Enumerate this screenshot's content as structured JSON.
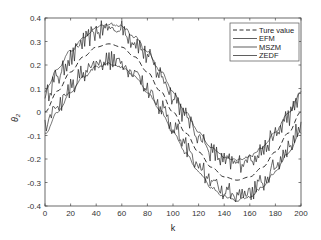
{
  "chart_data": {
    "type": "line",
    "title": "",
    "xlabel": "k",
    "ylabel": "θ2",
    "xlim": [
      0,
      200
    ],
    "ylim": [
      -0.4,
      0.4
    ],
    "xticks": [
      0,
      20,
      40,
      60,
      80,
      100,
      120,
      140,
      160,
      180,
      200
    ],
    "yticks": [
      0.4,
      0.3,
      0.2,
      0.1,
      0,
      -0.1,
      -0.2,
      -0.3,
      -0.4
    ],
    "ytick_labels": [
      "0.4",
      "0.3",
      "0.2",
      "0.1",
      "0",
      "-0.1",
      "-0.2",
      "-0.3",
      "-0.4"
    ],
    "grid": false,
    "legend_position": "upper right",
    "x": [
      0,
      10,
      20,
      30,
      40,
      50,
      60,
      70,
      80,
      90,
      100,
      110,
      120,
      130,
      140,
      150,
      160,
      170,
      180,
      190,
      200
    ],
    "series": [
      {
        "name": "Ture value",
        "style": "dashed",
        "values": [
          0.0,
          0.09,
          0.17,
          0.235,
          0.276,
          0.29,
          0.276,
          0.235,
          0.17,
          0.09,
          0.0,
          -0.09,
          -0.17,
          -0.235,
          -0.276,
          -0.29,
          -0.276,
          -0.235,
          -0.17,
          -0.09,
          0.0
        ]
      },
      {
        "name": "EFM",
        "style": "solid-noisy",
        "values": [
          0.07,
          0.15,
          0.23,
          0.3,
          0.34,
          0.36,
          0.35,
          0.3,
          0.24,
          0.16,
          0.07,
          -0.02,
          -0.1,
          -0.17,
          -0.21,
          -0.22,
          -0.2,
          -0.16,
          -0.1,
          -0.02,
          0.07
        ]
      },
      {
        "name": "MSZM",
        "style": "solid-noisy",
        "values": [
          -0.06,
          0.03,
          0.1,
          0.17,
          0.21,
          0.22,
          0.21,
          0.17,
          0.1,
          0.03,
          -0.06,
          -0.15,
          -0.23,
          -0.3,
          -0.34,
          -0.35,
          -0.34,
          -0.3,
          -0.23,
          -0.15,
          -0.06
        ]
      },
      {
        "name": "ZEDF",
        "style": "solid-smooth-envelope",
        "upper": [
          0.09,
          0.18,
          0.26,
          0.32,
          0.36,
          0.375,
          0.365,
          0.32,
          0.255,
          0.175,
          0.085,
          -0.005,
          -0.085,
          -0.15,
          -0.19,
          -0.205,
          -0.19,
          -0.15,
          -0.085,
          -0.005,
          0.085
        ],
        "lower": [
          -0.09,
          0.0,
          0.085,
          0.15,
          0.19,
          0.205,
          0.19,
          0.15,
          0.085,
          0.005,
          -0.085,
          -0.175,
          -0.255,
          -0.32,
          -0.36,
          -0.375,
          -0.36,
          -0.32,
          -0.255,
          -0.175,
          -0.085
        ]
      }
    ]
  },
  "legend": {
    "items": [
      {
        "label": "Ture value",
        "style": "dashed"
      },
      {
        "label": "EFM",
        "style": "solid"
      },
      {
        "label": "MSZM",
        "style": "solid"
      },
      {
        "label": "ZEDF",
        "style": "solid"
      }
    ]
  },
  "axes": {
    "xlabel": "k",
    "ylabel_main": "θ",
    "ylabel_sub": "2"
  },
  "colors": {
    "line": "#1a1a1a",
    "axis": "#444444",
    "background": "#ffffff"
  }
}
